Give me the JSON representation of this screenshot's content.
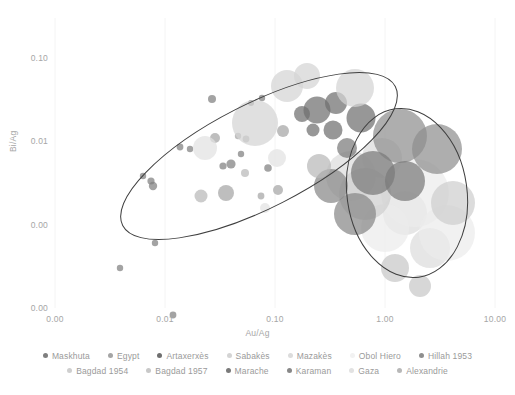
{
  "chart_data": {
    "type": "scatter",
    "title": "",
    "xlabel": "Au/Ag",
    "ylabel": "Bi/Ag",
    "x_scale": "log",
    "y_scale": "log",
    "xlim": [
      0.001,
      10.0
    ],
    "ylim": [
      0.0001,
      0.3
    ],
    "grid": "vertical-faint",
    "legend_position": "bottom",
    "xticks": [
      {
        "value": 0.001,
        "label": "0.00"
      },
      {
        "value": 0.01,
        "label": "0.01"
      },
      {
        "value": 0.1,
        "label": "0.10"
      },
      {
        "value": 1.0,
        "label": "1.00"
      },
      {
        "value": 10.0,
        "label": "10.00"
      }
    ],
    "yticks": [
      {
        "value": 0.1,
        "label": "0.10"
      },
      {
        "value": 0.01,
        "label": "0.01"
      },
      {
        "value": 0.001,
        "label": "0.00"
      },
      {
        "value": 0.0001,
        "label": "0.00"
      }
    ],
    "annotations": [
      {
        "name": "left-ellipse",
        "type": "ellipse",
        "cx": 204,
        "cy": 138,
        "rx": 153,
        "ry": 52,
        "rotation": -27,
        "stroke": "#3f3f3f"
      },
      {
        "name": "right-ellipse",
        "type": "ellipse",
        "cx": 352,
        "cy": 175,
        "rx": 60,
        "ry": 85,
        "rotation": -8,
        "stroke": "#3f3f3f"
      }
    ],
    "series": [
      {
        "name": "Maskhuta",
        "color": "#7f7f7f",
        "points": [
          {
            "px": 100,
            "py": 225,
            "r": 3.2
          },
          {
            "px": 65,
            "py": 250,
            "r": 3.2
          },
          {
            "px": 118,
            "py": 297,
            "r": 3.4
          },
          {
            "px": 88,
            "py": 158,
            "r": 3.2
          },
          {
            "px": 96,
            "py": 163,
            "r": 3.6
          },
          {
            "px": 98,
            "py": 168,
            "r": 4.2
          },
          {
            "px": 125,
            "py": 129,
            "r": 3.4
          },
          {
            "px": 135,
            "py": 131,
            "r": 3.2
          },
          {
            "px": 157,
            "py": 81,
            "r": 4.0
          },
          {
            "px": 168,
            "py": 148,
            "r": 3.6
          },
          {
            "px": 176,
            "py": 146,
            "r": 4.6
          },
          {
            "px": 186,
            "py": 136,
            "r": 3.2
          },
          {
            "px": 196,
            "py": 85,
            "r": 3.0
          },
          {
            "px": 207,
            "py": 80,
            "r": 3.2
          },
          {
            "px": 213,
            "py": 150,
            "r": 3.8
          }
        ]
      },
      {
        "name": "Egypt",
        "color": "#a5a5a5",
        "points": [
          {
            "px": 160,
            "py": 120,
            "r": 5.0
          },
          {
            "px": 171,
            "py": 175,
            "r": 8.0
          },
          {
            "px": 183,
            "py": 118,
            "r": 3.2
          },
          {
            "px": 191,
            "py": 121,
            "r": 3.4
          },
          {
            "px": 206,
            "py": 178,
            "r": 3.4
          },
          {
            "px": 223,
            "py": 172,
            "r": 5.0
          },
          {
            "px": 228,
            "py": 113,
            "r": 6.0
          }
        ]
      },
      {
        "name": "Artaxerxès",
        "color": "#6f6f6f",
        "points": [
          {
            "px": 247,
            "py": 96,
            "r": 8.0
          },
          {
            "px": 262,
            "py": 92,
            "r": 13.5
          },
          {
            "px": 281,
            "py": 85,
            "r": 11.0
          },
          {
            "px": 258,
            "py": 112,
            "r": 6.5
          },
          {
            "px": 278,
            "py": 112,
            "r": 9.5
          },
          {
            "px": 306,
            "py": 100,
            "r": 14.5
          }
        ]
      },
      {
        "name": "Sabakès",
        "color": "#d4d4d4",
        "points": [
          {
            "px": 200,
            "py": 105,
            "r": 23.0
          },
          {
            "px": 232,
            "py": 68,
            "r": 16.0
          },
          {
            "px": 252,
            "py": 58,
            "r": 13.0
          },
          {
            "px": 300,
            "py": 70,
            "r": 19.0
          }
        ]
      },
      {
        "name": "Mazakès",
        "color": "#dcdcdc",
        "points": [
          {
            "px": 296,
            "py": 158,
            "r": 25.0
          },
          {
            "px": 327,
            "py": 140,
            "r": 20.0
          },
          {
            "px": 350,
            "py": 195,
            "r": 22.0
          },
          {
            "px": 375,
            "py": 230,
            "r": 20.0
          }
        ]
      },
      {
        "name": "Obol Hiero",
        "color": "#ebebeb",
        "points": [
          {
            "px": 360,
            "py": 175,
            "r": 34.0
          },
          {
            "px": 392,
            "py": 215,
            "r": 28.0
          },
          {
            "px": 330,
            "py": 210,
            "r": 24.0
          }
        ]
      },
      {
        "name": "Hillah 1953",
        "color": "#8f8f8f",
        "points": [
          {
            "px": 345,
            "py": 118,
            "r": 27.0
          },
          {
            "px": 382,
            "py": 131,
            "r": 25.0
          }
        ]
      },
      {
        "name": "Bagdad 1954",
        "color": "#cfcfcf",
        "points": [
          {
            "px": 310,
            "py": 176,
            "r": 26.0
          },
          {
            "px": 398,
            "py": 185,
            "r": 22.0
          }
        ]
      },
      {
        "name": "Bagdad 1957",
        "color": "#c8c8c8",
        "points": [
          {
            "px": 340,
            "py": 250,
            "r": 14.0
          },
          {
            "px": 365,
            "py": 268,
            "r": 11.0
          }
        ]
      },
      {
        "name": "Marache",
        "color": "#7a7a7a",
        "points": [
          {
            "px": 292,
            "py": 130,
            "r": 10.0
          },
          {
            "px": 318,
            "py": 155,
            "r": 22.0
          },
          {
            "px": 350,
            "py": 163,
            "r": 20.0
          }
        ]
      },
      {
        "name": "Karaman",
        "color": "#888888",
        "points": [
          {
            "px": 276,
            "py": 168,
            "r": 17.0
          },
          {
            "px": 300,
            "py": 196,
            "r": 21.0
          }
        ]
      },
      {
        "name": "Gaza",
        "color": "#e2e2e2",
        "points": [
          {
            "px": 150,
            "py": 130,
            "r": 12.0
          },
          {
            "px": 222,
            "py": 140,
            "r": 9.0
          },
          {
            "px": 210,
            "py": 190,
            "r": 5.0
          }
        ]
      },
      {
        "name": "Alexandrie",
        "color": "#b8b8b8",
        "points": [
          {
            "px": 146,
            "py": 178,
            "r": 6.5
          },
          {
            "px": 190,
            "py": 155,
            "r": 4.0
          },
          {
            "px": 264,
            "py": 148,
            "r": 12.0
          }
        ]
      }
    ]
  },
  "legend": {
    "rows": [
      [
        {
          "label": "Maskhuta",
          "color": "#7f7f7f"
        },
        {
          "label": "Egypt",
          "color": "#a5a5a5"
        },
        {
          "label": "Artaxerxès",
          "color": "#6f6f6f"
        },
        {
          "label": "Sabakès",
          "color": "#d4d4d4"
        },
        {
          "label": "Mazakès",
          "color": "#dcdcdc"
        },
        {
          "label": "Obol Hiero",
          "color": "#f2f2f2"
        },
        {
          "label": "Hillah 1953",
          "color": "#8f8f8f"
        }
      ],
      [
        {
          "label": "Bagdad 1954",
          "color": "#cfcfcf"
        },
        {
          "label": "Bagdad 1957",
          "color": "#c8c8c8"
        },
        {
          "label": "Marache",
          "color": "#7a7a7a"
        },
        {
          "label": "Karaman",
          "color": "#888888"
        },
        {
          "label": "Gaza",
          "color": "#e2e2e2"
        },
        {
          "label": "Alexandrie",
          "color": "#b8b8b8"
        }
      ]
    ]
  }
}
